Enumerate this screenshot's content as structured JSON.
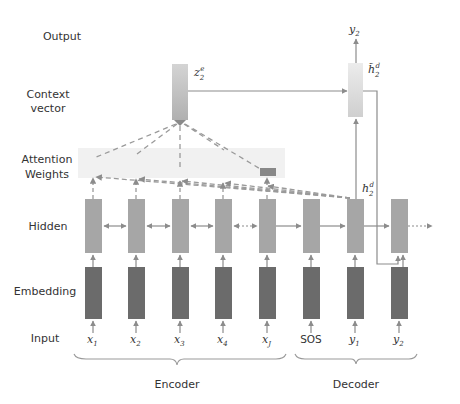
{
  "diagram": {
    "type": "seq2seq-attention",
    "row_labels": {
      "output": "Output",
      "context_1": "Context",
      "context_2": "vector",
      "attention_1": "Attention",
      "attention_2": "Weights",
      "hidden": "Hidden",
      "embedding": "Embedding",
      "input": "Input"
    },
    "inputs": [
      {
        "base": "x",
        "sub": "1"
      },
      {
        "base": "x",
        "sub": "2"
      },
      {
        "base": "x",
        "sub": "3"
      },
      {
        "base": "x",
        "sub": "4"
      },
      {
        "base": "x",
        "sub": "J"
      },
      {
        "plain": "SOS"
      },
      {
        "base": "y",
        "sub": "1"
      },
      {
        "base": "y",
        "sub": "2"
      }
    ],
    "nodes": {
      "context": {
        "base": "z",
        "sub": "2",
        "sup": "e"
      },
      "attentional_hidden": {
        "base": "h̃",
        "sub": "2",
        "sup": "d"
      },
      "decoder_hidden": {
        "base": "h",
        "sub": "2",
        "sup": "d"
      },
      "output": {
        "base": "y",
        "sub": "2"
      }
    },
    "groups": {
      "encoder": "Encoder",
      "decoder": "Decoder"
    },
    "colors": {
      "hidden": "#a6a6a6",
      "embedding": "#6b6b6b",
      "context_top": "#d9d9d9",
      "context_bottom": "#b3b3b3",
      "attn_band": "#efefef",
      "arrow": "#8c8c8c",
      "text": "#333333"
    }
  }
}
